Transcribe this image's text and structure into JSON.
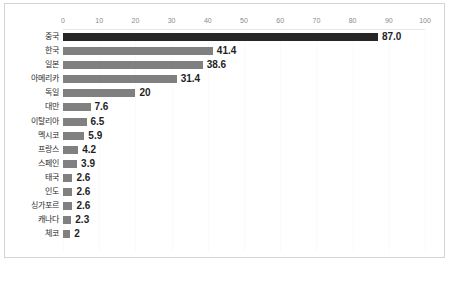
{
  "chart_data": {
    "type": "bar",
    "orientation": "horizontal",
    "title": "",
    "xlabel": "",
    "ylabel": "",
    "xlim": [
      0,
      100
    ],
    "xticks": [
      0,
      10,
      20,
      30,
      40,
      50,
      60,
      70,
      80,
      90,
      100
    ],
    "xtick_labels": [
      "0",
      "10",
      "20",
      "30",
      "40",
      "50",
      "60",
      "70",
      "80",
      "90",
      "100"
    ],
    "grid": true,
    "legend": false,
    "categories": [
      "중국",
      "한국",
      "일본",
      "아메리카",
      "독일",
      "대만",
      "이탈리아",
      "멕시코",
      "프랑스",
      "스페인",
      "태국",
      "인도",
      "싱가포르",
      "캐나다",
      "체코"
    ],
    "values": [
      87.0,
      41.4,
      38.6,
      31.4,
      20,
      7.6,
      6.5,
      5.9,
      4.2,
      3.9,
      2.6,
      2.6,
      2.6,
      2.3,
      2
    ],
    "value_labels": [
      "87.0",
      "41.4",
      "38.6",
      "31.4",
      "20",
      "7.6",
      "6.5",
      "5.9",
      "4.2",
      "3.9",
      "2.6",
      "2.6",
      "2.6",
      "2.3",
      "2"
    ],
    "highlight_index": 0,
    "colors": {
      "bar": "#808080",
      "bar_highlight": "#262626",
      "value_label": "#1f1f1f",
      "category_label": "#2b2b2b",
      "tick_label": "#8a8a8a",
      "gridline": "#fafafa",
      "border": "#d4d4d4",
      "background": "#ffffff"
    }
  }
}
